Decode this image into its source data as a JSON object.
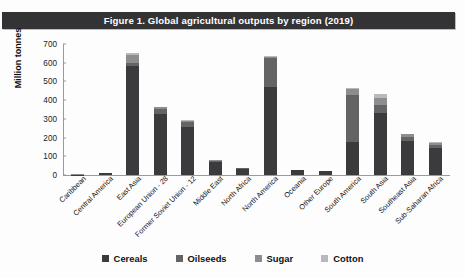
{
  "figure": {
    "title": "Figure 1.  Global agricultural outputs by region (2019)",
    "banner_color": "#333335"
  },
  "chart_data": {
    "type": "bar",
    "stacked": true,
    "title": "Figure 1.  Global agricultural outputs by region (2019)",
    "xlabel": "",
    "ylabel": "Million tonnes",
    "ylim": [
      0,
      700
    ],
    "yticks": [
      0,
      100,
      200,
      300,
      400,
      500,
      600,
      700
    ],
    "grid": false,
    "legend_position": "bottom",
    "categories": [
      "Caribbean",
      "Central America",
      "East Asia",
      "European Union - 28",
      "Former Soviet Union - 12",
      "Middle East",
      "North Africa",
      "North America",
      "Oceania",
      "Other Europe",
      "South America",
      "South Asia",
      "Southeast Asia",
      "Sub-Saharan Africa"
    ],
    "series": [
      {
        "name": "Cereals",
        "color": "#3b3b3d",
        "values": [
          2,
          9,
          580,
          325,
          258,
          72,
          33,
          470,
          25,
          19,
          175,
          330,
          180,
          145
        ]
      },
      {
        "name": "Oilseeds",
        "color": "#646466",
        "values": [
          0,
          1,
          18,
          30,
          27,
          4,
          3,
          155,
          3,
          2,
          250,
          45,
          25,
          18
        ]
      },
      {
        "name": "Sugar",
        "color": "#8d8d8f",
        "values": [
          1,
          3,
          42,
          10,
          5,
          4,
          2,
          8,
          1,
          1,
          35,
          35,
          12,
          9
        ]
      },
      {
        "name": "Cotton",
        "color": "#b9b9bb",
        "values": [
          0,
          0,
          10,
          0,
          2,
          1,
          1,
          5,
          0,
          0,
          3,
          22,
          2,
          4
        ]
      }
    ],
    "totals": [
      3,
      13,
      650,
      365,
      292,
      81,
      39,
      638,
      29,
      22,
      463,
      432,
      219,
      176
    ]
  },
  "legend": {
    "items": [
      {
        "label": "Cereals",
        "color": "#3b3b3d"
      },
      {
        "label": "Oilseeds",
        "color": "#646466"
      },
      {
        "label": "Sugar",
        "color": "#8d8d8f"
      },
      {
        "label": "Cotton",
        "color": "#b9b9bb"
      }
    ]
  }
}
